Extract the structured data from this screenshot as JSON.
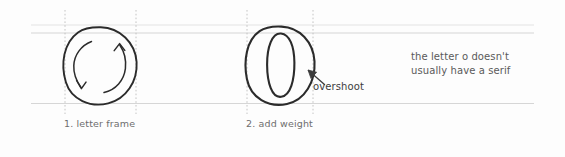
{
  "figure": {
    "background_color": "#fdfdfd",
    "width": 565,
    "height": 157
  },
  "guides": {
    "horizontal_color": "#d8d8d8",
    "vertical_color": "#b8b8b8",
    "overshoot_line_color": "#e4e4e4",
    "horizontal_lines": [
      {
        "name": "cap-overshoot-line",
        "y": 25
      },
      {
        "name": "cap-height-line",
        "y": 33
      },
      {
        "name": "baseline",
        "y": 103
      }
    ],
    "vertical_lines": [
      {
        "name": "frame-left-guide-1",
        "x": 65
      },
      {
        "name": "frame-right-guide-1",
        "x": 136
      },
      {
        "name": "frame-left-guide-2",
        "x": 247
      },
      {
        "name": "frame-right-guide-2",
        "x": 313
      }
    ]
  },
  "steps": [
    {
      "number": "1",
      "caption": "1. letter frame",
      "shape": "circle-outline-with-rotation-arrows",
      "stroke_color": "#2b2b2b"
    },
    {
      "number": "2",
      "caption": "2. add weight",
      "shape": "letter-o-with-counter",
      "stroke_color": "#2b2b2b"
    }
  ],
  "annotations": {
    "overshoot": {
      "label": "overshoot",
      "color": "#3c3c3c",
      "arrow_color": "#3c3c3c"
    },
    "serif_note": {
      "line_1": "the letter o doesn't",
      "line_2": "usually have a serif",
      "color": "#5a5a5a"
    }
  }
}
